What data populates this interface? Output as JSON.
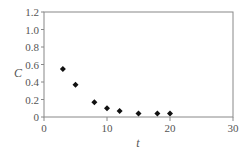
{
  "chart_data": {
    "type": "scatter",
    "title": "",
    "xlabel": "t",
    "ylabel": "C",
    "xlim": [
      0,
      30
    ],
    "ylim": [
      0,
      1.2
    ],
    "x_ticks": [
      0,
      10,
      20,
      30
    ],
    "y_ticks": [
      0,
      0.2,
      0.4,
      0.6,
      0.8,
      1.0,
      1.2
    ],
    "x_tick_labels": [
      "0",
      "10",
      "20",
      "30"
    ],
    "y_tick_labels": [
      "0",
      "0.2",
      "0.4",
      "0.6",
      "0.8",
      "1.0",
      "1.2"
    ],
    "grid": false,
    "legend": null,
    "marker": "diamond",
    "series": [
      {
        "name": "C",
        "x": [
          3,
          5,
          8,
          10,
          12,
          15,
          18,
          20
        ],
        "y": [
          0.55,
          0.37,
          0.17,
          0.1,
          0.07,
          0.04,
          0.04,
          0.04
        ]
      }
    ]
  },
  "colors": {
    "axis": "#888888",
    "marker": "#111111",
    "text": "#555555"
  }
}
